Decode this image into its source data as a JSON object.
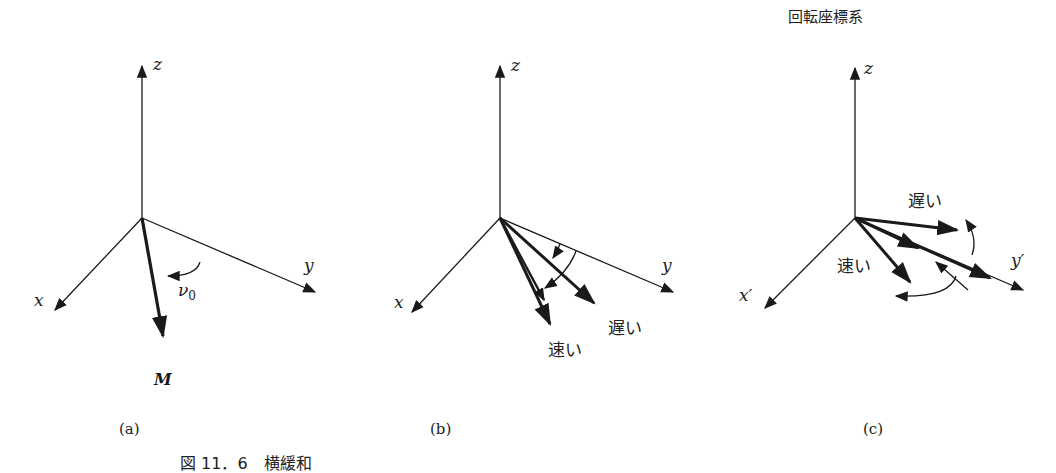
{
  "figure": {
    "title_c": "回転座標系",
    "caption": "図 11．6　横緩和",
    "panels": [
      {
        "id": "a",
        "label": "(a)",
        "axes": {
          "z": "z",
          "x": "x",
          "y": "y"
        },
        "vector_label": "M",
        "rotation_label": "ν",
        "rotation_subscript": "0"
      },
      {
        "id": "b",
        "label": "(b)",
        "axes": {
          "z": "z",
          "x": "x",
          "y": "y"
        },
        "slow_label": "遅い",
        "fast_label": "速い"
      },
      {
        "id": "c",
        "label": "(c)",
        "axes": {
          "z": "z",
          "x": "x′",
          "y": "y′"
        },
        "slow_label": "遅い",
        "fast_label": "速い"
      }
    ]
  },
  "colors": {
    "ink": "#1a1a1a",
    "background": "#ffffff"
  }
}
